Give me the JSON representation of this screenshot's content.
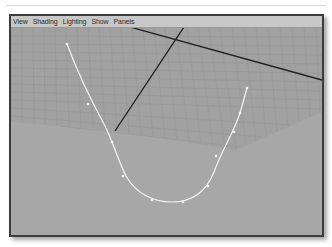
{
  "menubar": {
    "items": [
      {
        "label": "View"
      },
      {
        "label": "Shading"
      },
      {
        "label": "Lighting"
      },
      {
        "label": "Show"
      },
      {
        "label": "Panels"
      }
    ]
  },
  "viewport": {
    "background_color": "#a7a7a7",
    "grid_color": "#9b9b9b",
    "grid_fill": "#a2a2a2",
    "axis_color": "#1e1e1e",
    "curve_color": "#f2f2f2",
    "curve": {
      "type": "nurbs-curve",
      "control_points": [
        [
          67,
          44
        ],
        [
          88,
          104
        ],
        [
          112,
          142
        ],
        [
          123,
          176
        ],
        [
          152,
          200
        ],
        [
          183,
          202
        ],
        [
          208,
          186
        ],
        [
          216,
          156
        ],
        [
          234,
          132
        ],
        [
          240,
          113
        ],
        [
          247,
          88
        ]
      ]
    }
  }
}
